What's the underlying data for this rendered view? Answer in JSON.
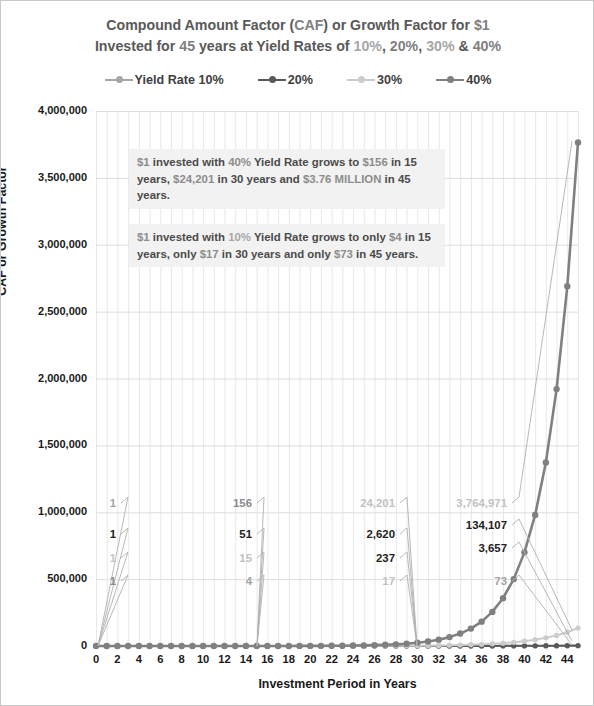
{
  "title": {
    "line1_part1": "Compound Amount Factor (",
    "line1_caf": "CAF",
    "line1_part2": ") or Growth Factor for ",
    "line1_dollar": "$1",
    "line2_part1": "Invested for ",
    "line2_years": "45",
    "line2_part2": " years at Yield Rates of ",
    "line2_r10": "10%",
    "line2_sep1": ", ",
    "line2_r20": "20%",
    "line2_sep2": ", ",
    "line2_r30": "30%",
    "line2_sep3": " & ",
    "line2_r40": "40%"
  },
  "legend": {
    "items": [
      {
        "label": "Yield Rate 10%",
        "color": "#a6a6a6"
      },
      {
        "label": "20%",
        "color": "#595959"
      },
      {
        "label": "30%",
        "color": "#cccccc"
      },
      {
        "label": "40%",
        "color": "#808080"
      }
    ]
  },
  "annotations": [
    {
      "name": "annotation-40-percent",
      "segments": [
        {
          "text": "$1",
          "style": "hl-money"
        },
        {
          "text": " invested with ",
          "style": ""
        },
        {
          "text": "40%",
          "style": "hl-40"
        },
        {
          "text": " Yield Rate grows to ",
          "style": ""
        },
        {
          "text": "$156",
          "style": "hl-money"
        },
        {
          "text": " in 15 years, ",
          "style": ""
        },
        {
          "text": "$24,201",
          "style": "hl-money"
        },
        {
          "text": " in 30 years and ",
          "style": ""
        },
        {
          "text": "$3.76 MILLION",
          "style": "hl-money"
        },
        {
          "text": " in 45 years.",
          "style": ""
        }
      ]
    },
    {
      "name": "annotation-10-percent",
      "segments": [
        {
          "text": "$1",
          "style": "hl-money"
        },
        {
          "text": " invested with ",
          "style": ""
        },
        {
          "text": "10%",
          "style": "hl-10"
        },
        {
          "text": " Yield Rate grows to only ",
          "style": ""
        },
        {
          "text": "$4",
          "style": "hl-money"
        },
        {
          "text": " in 15 years, only ",
          "style": ""
        },
        {
          "text": "$17",
          "style": "hl-money"
        },
        {
          "text": " in 30 years and only ",
          "style": ""
        },
        {
          "text": "$73",
          "style": "hl-money"
        },
        {
          "text": " in 45 years.",
          "style": ""
        }
      ]
    }
  ],
  "data_labels": [
    {
      "text": "1",
      "x": 115,
      "y": 502,
      "cls": "c10",
      "lx": 97,
      "ly": 645
    },
    {
      "text": "1",
      "x": 115,
      "y": 533,
      "cls": "c20",
      "lx": 97,
      "ly": 645
    },
    {
      "text": "1",
      "x": 115,
      "y": 557,
      "cls": "c30",
      "lx": 97,
      "ly": 645
    },
    {
      "text": "1",
      "x": 115,
      "y": 580,
      "cls": "c40",
      "lx": 97,
      "ly": 645
    },
    {
      "text": "156",
      "x": 251,
      "y": 502,
      "cls": "c40",
      "lx": 256,
      "ly": 645
    },
    {
      "text": "51",
      "x": 251,
      "y": 533,
      "cls": "c20",
      "lx": 256,
      "ly": 645
    },
    {
      "text": "15",
      "x": 251,
      "y": 557,
      "cls": "c30",
      "lx": 256,
      "ly": 645
    },
    {
      "text": "4",
      "x": 251,
      "y": 580,
      "cls": "c10",
      "lx": 256,
      "ly": 645
    },
    {
      "text": "24,201",
      "x": 394,
      "y": 502,
      "cls": "c30",
      "lx": 416,
      "ly": 645
    },
    {
      "text": "2,620",
      "x": 394,
      "y": 533,
      "cls": "c20",
      "lx": 416,
      "ly": 645
    },
    {
      "text": "237",
      "x": 394,
      "y": 557,
      "cls": "c20",
      "lx": 416,
      "ly": 645
    },
    {
      "text": "17",
      "x": 394,
      "y": 580,
      "cls": "c30",
      "lx": 416,
      "ly": 645
    },
    {
      "text": "3,764,971",
      "x": 506,
      "y": 502,
      "cls": "c30",
      "lx": 571,
      "ly": 140
    },
    {
      "text": "134,107",
      "x": 506,
      "y": 524,
      "cls": "c20",
      "lx": 571,
      "ly": 629
    },
    {
      "text": "3,657",
      "x": 506,
      "y": 547,
      "cls": "c20",
      "lx": 571,
      "ly": 640
    },
    {
      "text": "73",
      "x": 506,
      "y": 580,
      "cls": "c10",
      "lx": 571,
      "ly": 644
    }
  ],
  "chart_data": {
    "type": "line",
    "title": "Compound Amount Factor (CAF) or Growth Factor for $1 Invested for 45 years at Yield Rates of 10%, 20%, 30% & 40%",
    "xlabel": "Investment Period in Years",
    "ylabel": "CAF or Growth Factor",
    "xlim": [
      0,
      45
    ],
    "ylim": [
      0,
      4000000
    ],
    "ytick_labels": [
      "0",
      "500,000",
      "1,000,000",
      "1,500,000",
      "2,000,000",
      "2,500,000",
      "3,000,000",
      "3,500,000",
      "4,000,000"
    ],
    "ytick_values": [
      0,
      500000,
      1000000,
      1500000,
      2000000,
      2500000,
      3000000,
      3500000,
      4000000
    ],
    "xtick_labels": [
      "0",
      "2",
      "4",
      "6",
      "8",
      "10",
      "12",
      "14",
      "16",
      "18",
      "20",
      "22",
      "24",
      "26",
      "28",
      "30",
      "32",
      "34",
      "36",
      "38",
      "40",
      "42",
      "44"
    ],
    "grid": true,
    "legend_position": "top",
    "x": [
      0,
      1,
      2,
      3,
      4,
      5,
      6,
      7,
      8,
      9,
      10,
      11,
      12,
      13,
      14,
      15,
      16,
      17,
      18,
      19,
      20,
      21,
      22,
      23,
      24,
      25,
      26,
      27,
      28,
      29,
      30,
      31,
      32,
      33,
      34,
      35,
      36,
      37,
      38,
      39,
      40,
      41,
      42,
      43,
      44,
      45
    ],
    "series": [
      {
        "name": "Yield Rate 10%",
        "color": "#a6a6a6",
        "values": [
          1,
          1.1,
          1.21,
          1.33,
          1.46,
          1.61,
          1.77,
          1.95,
          2.14,
          2.36,
          2.59,
          2.85,
          3.14,
          3.45,
          3.8,
          4.18,
          4.59,
          5.05,
          5.56,
          6.12,
          6.73,
          7.4,
          8.14,
          8.95,
          9.85,
          10.83,
          11.92,
          13.11,
          14.42,
          15.86,
          17.45,
          19.19,
          21.11,
          23.23,
          25.55,
          28.1,
          30.91,
          34.0,
          37.4,
          41.14,
          45.26,
          49.79,
          54.76,
          60.24,
          66.26,
          72.89
        ],
        "labeled_points": {
          "0": 1,
          "15": 4,
          "30": 17,
          "45": 73
        }
      },
      {
        "name": "20%",
        "color": "#595959",
        "values": [
          1,
          1.2,
          1.44,
          1.73,
          2.07,
          2.49,
          2.99,
          3.58,
          4.3,
          5.16,
          6.19,
          7.43,
          8.92,
          10.7,
          12.84,
          15.41,
          18.49,
          22.19,
          26.62,
          31.95,
          38.34,
          46.01,
          55.21,
          66.25,
          79.5,
          95.4,
          114.48,
          137.37,
          164.84,
          197.81,
          237.38,
          284.85,
          341.82,
          410.19,
          492.22,
          590.67,
          708.8,
          850.56,
          1020.67,
          1224.81,
          1469.77,
          1763.73,
          2116.47,
          2539.77,
          3047.72,
          3657.26
        ],
        "labeled_points": {
          "0": 1,
          "15": 51,
          "30": 237,
          "45": 3657
        }
      },
      {
        "name": "30%",
        "color": "#cccccc",
        "values": [
          1,
          1.3,
          1.69,
          2.2,
          2.86,
          3.71,
          4.83,
          6.27,
          8.16,
          10.6,
          13.79,
          17.92,
          23.3,
          30.29,
          39.37,
          51.19,
          66.54,
          86.5,
          112.46,
          146.19,
          190.05,
          247.06,
          321.18,
          417.54,
          542.8,
          705.64,
          917.33,
          1192.53,
          1550.29,
          2015.38,
          2619.99,
          3405.99,
          4427.79,
          5756.13,
          7482.97,
          9727.86,
          12646.21,
          16440.08,
          21372.11,
          27783.74,
          36118.86,
          46954.52,
          61040.88,
          79353.14,
          103159.09,
          134106.82
        ],
        "labeled_points": {
          "0": 1,
          "15": 15,
          "30": 2620,
          "45": 134107
        }
      },
      {
        "name": "40%",
        "color": "#808080",
        "values": [
          1,
          1.4,
          1.96,
          2.74,
          3.84,
          5.38,
          7.53,
          10.54,
          14.76,
          20.66,
          28.93,
          40.5,
          56.69,
          79.37,
          111.12,
          155.57,
          217.8,
          304.91,
          426.88,
          597.63,
          836.68,
          1171.36,
          1639.9,
          2295.86,
          3214.2,
          4499.88,
          6299.83,
          8819.76,
          12347.67,
          17286.74,
          24201.43,
          33882.01,
          47434.81,
          66408.73,
          92972.23,
          130161.12,
          182225.57,
          255115.8,
          357162.12,
          500026.97,
          700037.76,
          980052.86,
          1372074,
          1920903.6,
          2689265,
          3764971.1
        ],
        "labeled_points": {
          "0": 1,
          "15": 156,
          "30": 24201,
          "45": 3764971
        }
      }
    ]
  }
}
